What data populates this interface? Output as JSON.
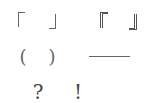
{
  "rows": [
    {
      "items": [
        {
          "name": "corner-bracket-open",
          "char": "「"
        },
        {
          "name": "corner-bracket-close",
          "char": "」"
        },
        {
          "name": "white-corner-bracket-open",
          "char": "『"
        },
        {
          "name": "white-corner-bracket-close",
          "char": "』"
        }
      ]
    },
    {
      "items": [
        {
          "name": "paren-open",
          "char": "("
        },
        {
          "name": "paren-close",
          "char": ")"
        },
        {
          "name": "dash",
          "char": "——"
        }
      ]
    },
    {
      "items": [
        {
          "name": "question-mark",
          "char": "?"
        },
        {
          "name": "exclamation-mark",
          "char": "!"
        }
      ]
    }
  ],
  "colors": {
    "background": "#ffffff",
    "ink": "#555555"
  }
}
